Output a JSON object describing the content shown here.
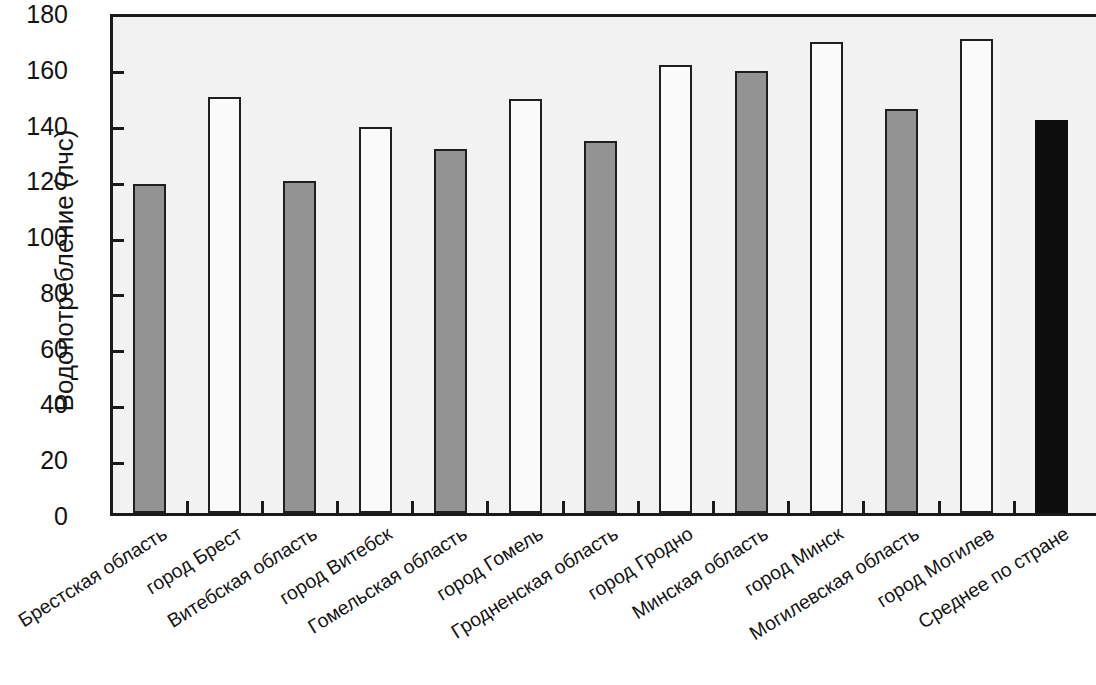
{
  "chart_data": {
    "type": "bar",
    "title": "",
    "xlabel": "",
    "ylabel": "Водопотребление (лчс)",
    "ylim": [
      0,
      180
    ],
    "yticks": [
      0,
      20,
      40,
      60,
      80,
      100,
      120,
      140,
      160,
      180
    ],
    "grid": false,
    "legend": null,
    "categories": [
      "Брестская область",
      "город Брест",
      "Витебская область",
      "город Витебск",
      "Гомельская область",
      "город Гомель",
      "Гродненская область",
      "город Гродно",
      "Минская область",
      "город Минск",
      "Могилевская область",
      "город Могилев",
      "Среднее по стране"
    ],
    "values": [
      118,
      149,
      119,
      138.5,
      130.5,
      148.5,
      133.5,
      160.5,
      158.5,
      169,
      145,
      170,
      141
    ],
    "bar_styles": [
      "gray",
      "white",
      "gray",
      "white",
      "gray",
      "white",
      "gray",
      "white",
      "gray",
      "white",
      "gray",
      "white",
      "black"
    ],
    "colors": {
      "oblast_fill": "#939393",
      "city_fill": "#fbfbfb",
      "country_average_fill": "#0d0d0d",
      "bar_outline": "#1f1f1f",
      "plot_background": "#f2f2f2",
      "axis": "#1a1a1a",
      "text": "#141414"
    }
  }
}
